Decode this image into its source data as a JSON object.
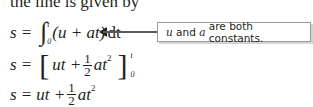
{
  "intro_text": "the line is given by",
  "equations": [
    {
      "lhs": "s",
      "eq": "=",
      "integral": {
        "lower": "0",
        "upper": "t",
        "integrand": "(u + at)",
        "differential": "dt"
      }
    },
    {
      "lhs": "s",
      "eq": "=",
      "expr_a": "ut +",
      "frac": {
        "num": "1",
        "den": "2"
      },
      "expr_b": "at",
      "exp": "2",
      "limits": {
        "upper": "t",
        "lower": "0"
      }
    },
    {
      "lhs": "s",
      "eq": "=",
      "expr_a": "ut +",
      "frac": {
        "num": "1",
        "den": "2"
      },
      "expr_b": "at",
      "exp": "2"
    }
  ],
  "callout": {
    "var1": "u",
    "and": "and",
    "var2": "a",
    "rest": "are both constants."
  },
  "colors": {
    "text": "#231f20",
    "callout_border": "#9a9a9a",
    "callout_shadow": "#d4d4d4"
  }
}
